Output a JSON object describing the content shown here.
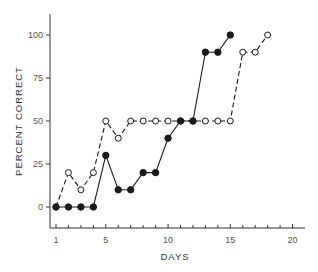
{
  "chart_data": {
    "type": "line",
    "title": "",
    "xlabel": "DAYS",
    "ylabel": "PERCENT CORRECT",
    "xlim": [
      0,
      21
    ],
    "ylim": [
      -12,
      112
    ],
    "x_ticks_major": [
      1,
      5,
      10,
      15,
      20
    ],
    "x_tick_labels": [
      "1",
      "5",
      "10",
      "15",
      "20"
    ],
    "x_ticks_minor": [
      2,
      3,
      4,
      6,
      7,
      8,
      9,
      11,
      12,
      13,
      14,
      16,
      17,
      18,
      19
    ],
    "y_ticks": [
      0,
      25,
      50,
      75,
      100
    ],
    "y_tick_labels": [
      "0",
      "25",
      "50",
      "75",
      "100"
    ],
    "grid": false,
    "legend": null,
    "series": [
      {
        "name": "filled-circles-solid",
        "marker": "filled-circle",
        "line_style": "solid",
        "x": [
          1,
          2,
          3,
          4,
          5,
          6,
          7,
          8,
          9,
          10,
          11,
          12,
          13,
          14,
          15
        ],
        "values": [
          0,
          0,
          0,
          0,
          30,
          10,
          10,
          20,
          20,
          40,
          50,
          50,
          90,
          90,
          100
        ]
      },
      {
        "name": "open-circles-dashed",
        "marker": "open-circle",
        "line_style": "dashed",
        "x": [
          1,
          2,
          3,
          4,
          5,
          6,
          7,
          8,
          9,
          10,
          11,
          12,
          13,
          14,
          15,
          16,
          17,
          18
        ],
        "values": [
          0,
          20,
          10,
          20,
          50,
          40,
          50,
          50,
          50,
          50,
          50,
          50,
          50,
          50,
          50,
          90,
          90,
          100
        ]
      }
    ],
    "colors": {
      "ink": "#1a1a1a",
      "background": "#ffffff"
    }
  }
}
